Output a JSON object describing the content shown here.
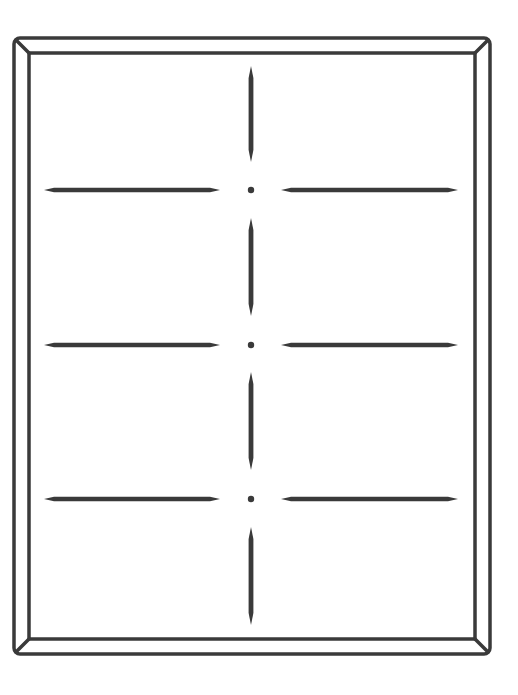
{
  "diagram": {
    "type": "frame-with-dividers",
    "stroke_color": "#3a3a3a",
    "background": "#ffffff",
    "outer_frame": {
      "x": 14,
      "y": 38,
      "width": 476,
      "height": 616,
      "radius": 6
    },
    "inner_frame": {
      "x": 29,
      "y": 53,
      "width": 446,
      "height": 586
    },
    "center_x": 251,
    "horizontal_dividers": [
      {
        "y": 190,
        "left": [
          44,
          220
        ],
        "right": [
          281,
          458
        ]
      },
      {
        "y": 345,
        "left": [
          44,
          220
        ],
        "right": [
          281,
          458
        ]
      },
      {
        "y": 499,
        "left": [
          44,
          220
        ],
        "right": [
          281,
          458
        ]
      }
    ],
    "vertical_segments": [
      [
        66,
        162
      ],
      [
        218,
        316
      ],
      [
        372,
        470
      ],
      [
        527,
        625
      ]
    ]
  }
}
